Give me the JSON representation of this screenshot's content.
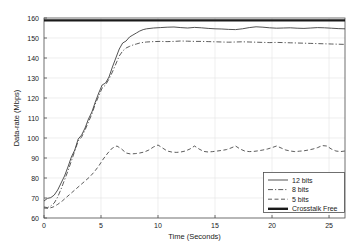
{
  "chart_data": {
    "type": "line",
    "title": "",
    "xlabel": "Time (Seconds)",
    "ylabel": "Data-rate (Mbps)",
    "xlim": [
      0,
      26.4
    ],
    "ylim": [
      60,
      160
    ],
    "xticks": [
      0,
      5,
      10,
      15,
      20,
      25
    ],
    "yticks": [
      60,
      70,
      80,
      90,
      100,
      110,
      120,
      130,
      140,
      150,
      160
    ],
    "xtick_labels": [
      "0",
      "5",
      "10",
      "15",
      "20",
      "25"
    ],
    "ytick_labels": [
      "60",
      "70",
      "80",
      "90",
      "100",
      "110",
      "120",
      "130",
      "140",
      "150",
      "160"
    ],
    "grid": true,
    "legend_position": "lower right",
    "series": [
      {
        "name": "12 bits",
        "style": "solid",
        "color": "#404040",
        "width": 0.9,
        "x": [
          0,
          0.3,
          0.6,
          0.9,
          1.2,
          1.5,
          1.8,
          2.1,
          2.4,
          2.7,
          3.0,
          3.3,
          3.6,
          3.9,
          4.2,
          4.5,
          4.8,
          5.1,
          5.4,
          5.7,
          6.0,
          6.3,
          6.6,
          6.9,
          7.2,
          7.5,
          7.8,
          8.1,
          8.4,
          8.7,
          9.0,
          9.6,
          10.2,
          10.8,
          11.4,
          12.0,
          12.6,
          13.2,
          13.8,
          14.4,
          15.0,
          15.6,
          16.2,
          16.8,
          17.4,
          18.0,
          18.6,
          19.2,
          19.8,
          20.4,
          21.0,
          21.6,
          22.2,
          22.8,
          23.4,
          24.0,
          24.6,
          25.2,
          25.8,
          26.4
        ],
        "y": [
          68.5,
          69.8,
          70.2,
          71.5,
          74.0,
          77.5,
          81.0,
          85.5,
          90.5,
          94.0,
          99.5,
          101.5,
          105.0,
          109.5,
          113.0,
          118.0,
          122.5,
          126.5,
          127.5,
          130.5,
          135.5,
          140.0,
          144.5,
          147.5,
          148.5,
          150.5,
          151.5,
          152.5,
          153.5,
          154.2,
          154.6,
          155.0,
          155.2,
          155.4,
          155.5,
          155.2,
          155.0,
          155.3,
          155.1,
          154.8,
          154.6,
          154.5,
          154.3,
          154.2,
          154.6,
          155.2,
          155.6,
          155.4,
          155.1,
          154.9,
          155.0,
          155.1,
          154.9,
          154.8,
          155.0,
          155.2,
          155.1,
          154.9,
          154.7,
          154.6
        ]
      },
      {
        "name": "8 bits",
        "style": "dashdot",
        "color": "#404040",
        "width": 0.85,
        "x": [
          0,
          0.3,
          0.6,
          0.9,
          1.2,
          1.5,
          1.8,
          2.1,
          2.4,
          2.7,
          3.0,
          3.3,
          3.6,
          3.9,
          4.2,
          4.5,
          4.8,
          5.1,
          5.4,
          5.7,
          6.0,
          6.3,
          6.6,
          6.9,
          7.2,
          7.5,
          7.8,
          8.1,
          8.4,
          8.7,
          9.0,
          9.6,
          10.2,
          10.8,
          11.4,
          12.0,
          12.6,
          13.2,
          13.8,
          14.4,
          15.0,
          15.6,
          16.2,
          16.8,
          17.4,
          18.0,
          18.6,
          19.2,
          19.8,
          20.4,
          21.0,
          21.6,
          22.2,
          22.8,
          23.4,
          24.0,
          24.6,
          25.2,
          25.8,
          26.4
        ],
        "y": [
          65.5,
          65.2,
          66.0,
          67.5,
          70.5,
          74.5,
          79.0,
          83.5,
          88.5,
          93.5,
          98.5,
          100.5,
          104.0,
          108.0,
          112.0,
          117.0,
          121.0,
          125.0,
          126.5,
          129.5,
          133.0,
          137.0,
          141.0,
          143.5,
          145.0,
          145.8,
          146.5,
          147.0,
          147.5,
          147.8,
          148.0,
          148.2,
          148.3,
          148.2,
          148.3,
          148.5,
          148.4,
          148.3,
          148.3,
          148.2,
          148.1,
          148.0,
          147.9,
          148.0,
          148.1,
          148.0,
          147.9,
          147.8,
          147.7,
          147.8,
          147.7,
          147.6,
          147.5,
          147.4,
          147.3,
          147.2,
          147.1,
          147.0,
          146.9,
          146.8
        ]
      },
      {
        "name": "5 bits",
        "style": "dashed",
        "color": "#404040",
        "width": 0.85,
        "x": [
          0,
          0.4,
          0.8,
          1.2,
          1.6,
          2.0,
          2.4,
          2.8,
          3.2,
          3.6,
          4.0,
          4.4,
          4.8,
          5.2,
          5.6,
          6.0,
          6.4,
          6.8,
          7.2,
          7.6,
          8.0,
          8.4,
          8.8,
          9.2,
          9.6,
          10.0,
          10.4,
          10.8,
          11.2,
          11.6,
          12.0,
          12.4,
          12.8,
          13.2,
          13.6,
          14.0,
          14.4,
          14.8,
          15.2,
          15.6,
          16.0,
          16.4,
          16.8,
          17.2,
          17.6,
          18.0,
          18.4,
          18.8,
          19.2,
          19.6,
          20.0,
          20.4,
          20.8,
          21.2,
          21.6,
          22.0,
          22.4,
          22.8,
          23.2,
          23.6,
          24.0,
          24.4,
          24.8,
          25.2,
          25.6,
          26.0,
          26.4
        ],
        "y": [
          65.0,
          64.8,
          65.5,
          66.8,
          68.5,
          70.5,
          72.5,
          74.5,
          76.5,
          78.5,
          80.5,
          83.0,
          86.0,
          89.5,
          92.5,
          95.0,
          96.0,
          94.5,
          92.5,
          92.0,
          92.2,
          92.5,
          93.0,
          94.0,
          95.5,
          96.5,
          95.0,
          93.5,
          93.0,
          92.8,
          93.0,
          93.5,
          94.5,
          96.0,
          94.5,
          93.3,
          93.0,
          93.2,
          93.5,
          93.8,
          94.2,
          95.0,
          96.0,
          94.5,
          93.5,
          93.2,
          93.3,
          93.6,
          94.0,
          94.5,
          95.2,
          96.0,
          95.0,
          94.0,
          93.5,
          93.2,
          93.4,
          93.6,
          94.0,
          94.5,
          95.2,
          96.2,
          96.0,
          94.5,
          93.5,
          93.2,
          93.5
        ]
      },
      {
        "name": "Crosstalk Free",
        "style": "thick-solid",
        "color": "#1a1a1a",
        "width": 2.4,
        "x": [
          0,
          26.4
        ],
        "y": [
          158.8,
          158.8
        ]
      }
    ]
  },
  "legend": {
    "items": [
      {
        "label": "12 bits"
      },
      {
        "label": "8 bits"
      },
      {
        "label": "5 bits"
      },
      {
        "label": "Crosstalk Free"
      }
    ]
  }
}
